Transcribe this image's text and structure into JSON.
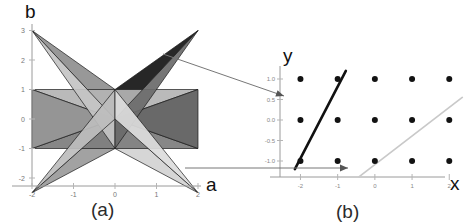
{
  "figure": {
    "panels": [
      {
        "id": "a",
        "caption": "(a)",
        "xlabel": "a",
        "ylabel": "b",
        "xticks": [
          "-2",
          "-1",
          "0",
          "1",
          "2"
        ],
        "yticks": [
          "3",
          "2",
          "1",
          "0",
          "-1",
          "-2"
        ]
      },
      {
        "id": "b",
        "caption": "(b)",
        "xlabel": "x",
        "ylabel": "y",
        "xticks": [
          "-2",
          "-1",
          "0",
          "1",
          "2"
        ],
        "yticks": [
          "1.0",
          "0.5",
          "0.0",
          "-0.5",
          "-1.0"
        ]
      }
    ]
  },
  "colors": {
    "background": "#ffffff",
    "axis": "#9a9a9a",
    "tick_text": "#808080",
    "label_text": "#111111",
    "dot": "#121212",
    "line_dark": "#111111",
    "line_light": "#c9c9c9",
    "arrow": "#777777",
    "shade_1": "#e2e2e2",
    "shade_2": "#cfcfcf",
    "shade_3": "#b4b4b4",
    "shade_4": "#9a9a9a",
    "shade_5": "#7d7d7d",
    "shade_6": "#646464",
    "shade_7": "#4a4a4a",
    "shade_8": "#2b2b2b",
    "shade_9": "#151515"
  },
  "chart_data": [
    {
      "type": "area",
      "title": "(a)",
      "xlabel": "a",
      "ylabel": "b",
      "xlim": [
        -2.45,
        2.45
      ],
      "ylim": [
        -2.8,
        3.35
      ],
      "xticks": [
        -2,
        -1,
        0,
        1,
        2
      ],
      "yticks": [
        3,
        2,
        1,
        0,
        -1,
        -2
      ],
      "grid": false,
      "legend": "none",
      "description": "Overlapping shaded triangular regions forming an eight-pointed star centred on the origin",
      "polygons": [
        {
          "name": "tri-up-left-dark",
          "shade": "#8f8f8f",
          "points": [
            [
              -2,
              3
            ],
            [
              0,
              0
            ],
            [
              0,
              1
            ]
          ]
        },
        {
          "name": "tri-up-right-black",
          "shade": "#151515",
          "points": [
            [
              2,
              3
            ],
            [
              0,
              0
            ],
            [
              0,
              1
            ]
          ]
        },
        {
          "name": "tri-down-left",
          "shade": "#9a9a9a",
          "points": [
            [
              -2,
              -2.5
            ],
            [
              0,
              0
            ],
            [
              0,
              -1
            ]
          ]
        },
        {
          "name": "tri-down-right",
          "shade": "#d2d2d2",
          "points": [
            [
              2,
              -2.5
            ],
            [
              0,
              0
            ],
            [
              0,
              -1
            ]
          ]
        },
        {
          "name": "band-left-upper",
          "shade": "#b4b4b4",
          "points": [
            [
              -2,
              1
            ],
            [
              2,
              1
            ],
            [
              0,
              0
            ]
          ]
        },
        {
          "name": "band-left-lower",
          "shade": "#7d7d7d",
          "points": [
            [
              -2,
              -1
            ],
            [
              2,
              -1
            ],
            [
              0,
              0
            ]
          ]
        },
        {
          "name": "wedge-left-mid",
          "shade": "#8c8c8c",
          "points": [
            [
              -2,
              1
            ],
            [
              -2,
              -1
            ],
            [
              0,
              0
            ]
          ]
        },
        {
          "name": "wedge-right-mid",
          "shade": "#5c5c5c",
          "points": [
            [
              2,
              1
            ],
            [
              2,
              -1
            ],
            [
              0,
              0
            ]
          ]
        },
        {
          "name": "sliver-ul",
          "shade": "#c4c4c4",
          "points": [
            [
              -2,
              3
            ],
            [
              0,
              -1
            ],
            [
              0,
              0
            ]
          ]
        },
        {
          "name": "sliver-ur",
          "shade": "#6a6a6a",
          "points": [
            [
              2,
              3
            ],
            [
              0,
              -1
            ],
            [
              0,
              0
            ]
          ]
        },
        {
          "name": "sliver-ll",
          "shade": "#bdbdbd",
          "points": [
            [
              -2,
              -2.5
            ],
            [
              0,
              1
            ],
            [
              0,
              0
            ]
          ]
        },
        {
          "name": "sliver-lr",
          "shade": "#dcdcdc",
          "points": [
            [
              2,
              -2.5
            ],
            [
              0,
              1
            ],
            [
              0,
              0
            ]
          ]
        }
      ]
    },
    {
      "type": "scatter",
      "title": "(b)",
      "xlabel": "x",
      "ylabel": "y",
      "xlim": [
        -2.6,
        2.6
      ],
      "ylim": [
        -1.55,
        1.35
      ],
      "xticks": [
        -2,
        -1,
        0,
        1,
        2
      ],
      "yticks": [
        1.0,
        0.5,
        0.0,
        -0.5,
        -1.0
      ],
      "grid": false,
      "legend": "none",
      "points": [
        {
          "x": -2,
          "y": 1.0
        },
        {
          "x": -1,
          "y": 1.0
        },
        {
          "x": 0,
          "y": 1.0
        },
        {
          "x": 1,
          "y": 1.0
        },
        {
          "x": 2,
          "y": 1.0
        },
        {
          "x": -2,
          "y": 0.0
        },
        {
          "x": -1,
          "y": 0.0
        },
        {
          "x": 0,
          "y": 0.0
        },
        {
          "x": 1,
          "y": 0.0
        },
        {
          "x": 2,
          "y": 0.0
        },
        {
          "x": -2,
          "y": -1.0
        },
        {
          "x": -1,
          "y": -1.0
        },
        {
          "x": 0,
          "y": -1.0
        },
        {
          "x": 1,
          "y": -1.0
        },
        {
          "x": 2,
          "y": -1.0
        }
      ],
      "lines": [
        {
          "name": "dark-line",
          "color": "#111111",
          "from": [
            -2.15,
            -1.2
          ],
          "to": [
            -0.78,
            1.2
          ],
          "through_points": [
            [
              -2,
              -1
            ],
            [
              -1,
              1
            ]
          ]
        },
        {
          "name": "light-line",
          "color": "#c9c9c9",
          "from": [
            -0.42,
            -1.38
          ],
          "to": [
            2.35,
            0.55
          ],
          "through_points": [
            [
              2,
              0
            ]
          ]
        }
      ]
    }
  ],
  "annotations": [
    {
      "name": "arrow-diagonal",
      "from_panel": "a",
      "to_panel": "b",
      "style": "thin-arrow"
    },
    {
      "name": "arrow-horizontal",
      "from_panel": "a",
      "to_panel": "b",
      "style": "thin-arrow"
    }
  ]
}
